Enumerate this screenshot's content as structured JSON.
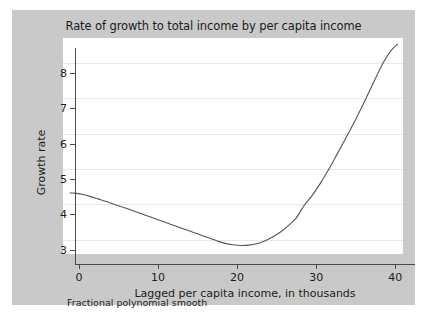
{
  "figure": {
    "title": "Rate of growth to total income by per capita income",
    "footnote": "Fractional polynomial smooth",
    "panel_color": "#c9c9c9",
    "plot_background": "#ffffff",
    "axis_color": "#4a4a4a",
    "grid_color": "#e8e8e8",
    "line_color": "#555555"
  },
  "chart_data": {
    "type": "line",
    "title": "Rate of growth to total income by per capita income",
    "subtitle": "",
    "xlabel": "Lagged per capita income, in thousands",
    "ylabel": "Growth rate",
    "annotations": [
      "Fractional polynomial smooth"
    ],
    "legend": [],
    "legend_position": "none",
    "grid": true,
    "xlim": [
      -0.5,
      42.5
    ],
    "ylim": [
      2.6,
      8.7
    ],
    "xticks": [
      0,
      10,
      20,
      30,
      40
    ],
    "yticks": [
      3,
      4,
      5,
      6,
      7,
      8
    ],
    "xtick_labels": [
      "0",
      "10",
      "20",
      "30",
      "40"
    ],
    "ytick_labels": [
      "3",
      "4",
      "5",
      "6",
      "7",
      "8"
    ],
    "series": [
      {
        "name": "Fractional polynomial smooth",
        "x": [
          0.4,
          1.0,
          2.0,
          3.0,
          4.0,
          5.0,
          6.0,
          7.0,
          8.0,
          9.0,
          10.0,
          11.0,
          12.0,
          13.0,
          14.0,
          15.0,
          16.0,
          17.0,
          18.0,
          19.0,
          20.0,
          21.0,
          22.0,
          23.0,
          24.0,
          25.0,
          26.0,
          27.0,
          28.0,
          29.0,
          30.0,
          31.0,
          32.0,
          33.0,
          34.0,
          35.0,
          36.0,
          37.0,
          38.0,
          39.0,
          40.0,
          41.0,
          41.8
        ],
        "y": [
          4.32,
          4.32,
          4.28,
          4.22,
          4.15,
          4.08,
          4.0,
          3.93,
          3.85,
          3.77,
          3.69,
          3.61,
          3.53,
          3.45,
          3.37,
          3.29,
          3.21,
          3.13,
          3.05,
          2.97,
          2.9,
          2.86,
          2.84,
          2.85,
          2.89,
          2.97,
          3.08,
          3.22,
          3.4,
          3.62,
          3.97,
          4.25,
          4.58,
          4.95,
          5.35,
          5.76,
          6.18,
          6.62,
          7.08,
          7.55,
          8.0,
          8.35,
          8.52
        ]
      }
    ]
  },
  "axes": {
    "y_title": "Growth rate",
    "x_title": "Lagged per capita income, in thousands"
  }
}
